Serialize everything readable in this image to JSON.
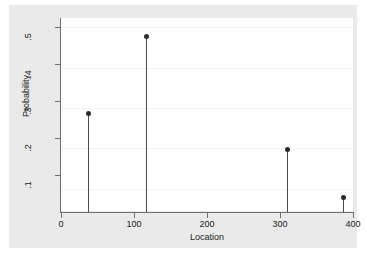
{
  "chart_data": {
    "type": "scatter",
    "title": "",
    "subtitle": "",
    "xlabel": "Location",
    "ylabel": "Probability",
    "xlim": [
      0,
      400
    ],
    "ylim": [
      0,
      0.5
    ],
    "xticks": [
      "0",
      "100",
      "200",
      "300",
      "400"
    ],
    "xtick_values": [
      0,
      100,
      200,
      300,
      400
    ],
    "yticks": [
      ".1",
      ".2",
      ".3",
      ".4",
      ".5"
    ],
    "ytick_values": [
      0.1,
      0.2,
      0.3,
      0.4,
      0.5
    ],
    "grid": "horizontal-faint",
    "legend": "none",
    "marker_color": "#2b2b2b",
    "spike_color": "#4a4a4a",
    "background_color": "#eaeaea",
    "plot_background_color": "#ffffff",
    "series": [
      {
        "name": "Probability",
        "style": "spike-with-marker",
        "x": [
          37,
          117,
          310,
          387
        ],
        "values": [
          0.267,
          0.474,
          0.17,
          0.04
        ]
      }
    ],
    "points": [
      {
        "x": 37,
        "y": 0.267
      },
      {
        "x": 117,
        "y": 0.474
      },
      {
        "x": 310,
        "y": 0.17
      },
      {
        "x": 387,
        "y": 0.04
      }
    ]
  }
}
